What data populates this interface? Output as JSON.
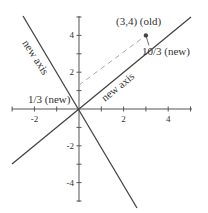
{
  "diagram": {
    "x_range": [
      -3,
      5
    ],
    "y_range": [
      -5,
      5
    ],
    "x_tick_labels": [
      {
        "v": -2,
        "t": "-2"
      },
      {
        "v": 2,
        "t": "2"
      },
      {
        "v": 4,
        "t": "4"
      }
    ],
    "y_tick_labels": [
      {
        "v": 4,
        "t": "4"
      },
      {
        "v": 2,
        "t": "2"
      },
      {
        "v": -2,
        "t": "-2"
      },
      {
        "v": -4,
        "t": "-4"
      }
    ],
    "x_ticks": [
      -3,
      -2,
      -1,
      1,
      2,
      3,
      4,
      5
    ],
    "y_ticks": [
      -5,
      -4,
      -3,
      -2,
      -1,
      1,
      2,
      3,
      4,
      5
    ],
    "point": {
      "x": 3,
      "y": 4
    },
    "new_axis_1_direction": [
      3,
      4
    ],
    "new_axis_2_direction": [
      -3,
      4
    ],
    "labels": {
      "point_old": "(3,4) (old)",
      "projection_new_1": "10/3 (new)",
      "projection_new_2": "1/3 (new)",
      "new_axis_a": "new axis",
      "new_axis_b": "new axis"
    },
    "colors": {
      "axis": "#555555",
      "line": "#444444",
      "dashed": "#aaaaaa",
      "point": "#444444"
    }
  }
}
